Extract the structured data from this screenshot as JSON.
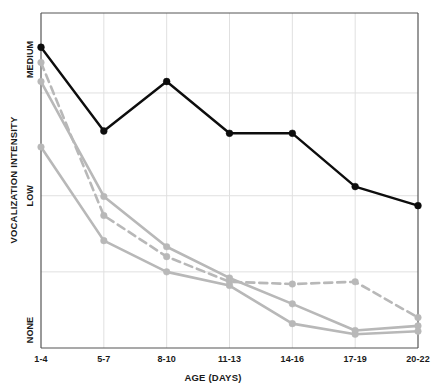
{
  "chart_data": {
    "type": "line",
    "title": "",
    "xlabel": "AGE (DAYS)",
    "ylabel": "VOCALIZATION INTENSITY",
    "categories": [
      "1-4",
      "5-7",
      "8-10",
      "11-13",
      "14-16",
      "17-19",
      "20-22"
    ],
    "ytick_labels": [
      "MEDIUM",
      "LOW",
      "NONE"
    ],
    "ytick_values": [
      4,
      2,
      0
    ],
    "ylim": [
      0,
      4.4
    ],
    "grid": true,
    "gridlines_y": [
      4.4,
      3.35,
      2.0,
      1.0,
      0.0
    ],
    "legend_position": "none",
    "series": [
      {
        "name": "series-black",
        "color": "#0d0d0d",
        "style": "solid",
        "marker": "circle",
        "values": [
          3.95,
          2.85,
          3.5,
          2.82,
          2.82,
          2.12,
          1.87
        ]
      },
      {
        "name": "series-gray-dashed",
        "color": "#b8b8b8",
        "style": "dashed",
        "marker": "circle",
        "values": [
          3.75,
          1.74,
          1.2,
          0.87,
          0.84,
          0.87,
          0.4
        ]
      },
      {
        "name": "series-gray-solid-upper",
        "color": "#b8b8b8",
        "style": "solid",
        "marker": "circle",
        "values": [
          3.5,
          1.99,
          1.33,
          0.92,
          0.58,
          0.23,
          0.29
        ]
      },
      {
        "name": "series-gray-solid-lower",
        "color": "#b8b8b8",
        "style": "solid",
        "marker": "circle",
        "values": [
          2.64,
          1.41,
          1.0,
          0.82,
          0.32,
          0.18,
          0.22
        ]
      }
    ]
  },
  "axes": {
    "x_title": "AGE (DAYS)",
    "y_title": "VOCALIZATION INTENSITY"
  }
}
